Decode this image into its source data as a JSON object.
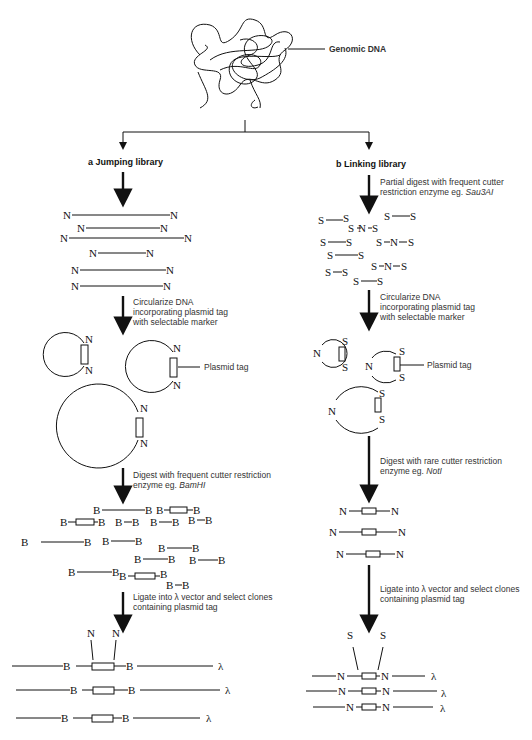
{
  "genomic": {
    "label": "Genomic DNA"
  },
  "jumping": {
    "title": "a Jumping library",
    "step1": {
      "line1": "Circularize DNA",
      "line2": "incorporating plasmid tag",
      "line3": "with selectable marker"
    },
    "plasmid_tag_label": "Plasmid tag",
    "step2": {
      "line1": "Digest with frequent cutter restriction",
      "line2_prefix": "enzyme eg. ",
      "enzyme": "BamHI"
    },
    "step3": {
      "line1": "Ligate into λ vector and select clones",
      "line2": "containing plasmid tag"
    },
    "site_N": "N",
    "site_B": "B",
    "lambda": "λ"
  },
  "linking": {
    "title": "b Linking library",
    "step0": {
      "line1": "Partial digest with frequent cutter",
      "line2_prefix": "restriction enzyme eg. ",
      "enzyme": "Sau3AI"
    },
    "step1": {
      "line1": "Circularize DNA",
      "line2": "incorporating plasmid tag",
      "line3": "with selectable marker"
    },
    "plasmid_tag_label": "Plasmid tag",
    "step2": {
      "line1": "Digest with rare cutter restriction",
      "line2_prefix": "enzyme eg. ",
      "enzyme": "NotI"
    },
    "step3": {
      "line1": "Ligate into λ vector and select clones",
      "line2": "containing plasmid tag"
    },
    "site_N": "N",
    "site_S": "S",
    "lambda": "λ"
  }
}
